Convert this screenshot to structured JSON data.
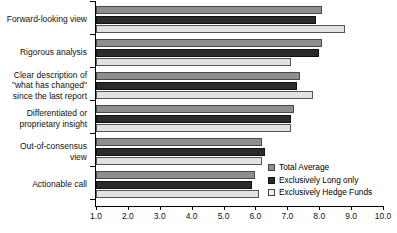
{
  "chart_data": {
    "type": "bar",
    "orientation": "horizontal",
    "title": "",
    "xlabel": "",
    "ylabel": "",
    "xlim": [
      1.0,
      10.0
    ],
    "grid": false,
    "legend_position": "inside-right",
    "xticks": [
      "1.0",
      "2.0",
      "3.0",
      "4.0",
      "5.0",
      "6.0",
      "7.0",
      "8.0",
      "9.0",
      "10.0"
    ],
    "categories": [
      "Forward-looking view",
      "Rigorous analysis",
      "Clear description of\n\"what has changed\"\nsince the last report",
      "Differentiated or\nproprietary insight",
      "Out-of-consensus\nview",
      "Actionable call"
    ],
    "series": [
      {
        "name": "Total Average",
        "color": "#8e8e8e",
        "values": [
          8.1,
          8.1,
          7.4,
          7.2,
          6.2,
          6.0
        ]
      },
      {
        "name": "Exclusively Long only",
        "color": "#2b2b2b",
        "values": [
          7.9,
          8.0,
          7.3,
          7.1,
          6.3,
          5.9
        ]
      },
      {
        "name": "Exclusively Hedge Funds",
        "color": "#e2e2e2",
        "values": [
          8.8,
          7.1,
          7.8,
          7.1,
          6.2,
          6.1
        ]
      }
    ]
  }
}
